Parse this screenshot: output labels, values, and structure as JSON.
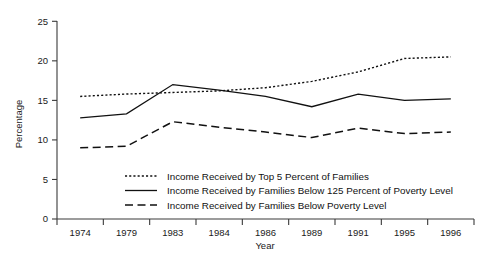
{
  "chart_data": {
    "type": "line",
    "title": "",
    "xlabel": "Year",
    "ylabel": "Percentage",
    "categories": [
      "1974",
      "1979",
      "1983",
      "1984",
      "1986",
      "1989",
      "1991",
      "1995",
      "1996"
    ],
    "x": [
      1974,
      1979,
      1983,
      1984,
      1986,
      1989,
      1991,
      1995,
      1996
    ],
    "ylim": [
      0,
      25
    ],
    "yticks": [
      0,
      5,
      10,
      15,
      20,
      25
    ],
    "ytick_labels": [
      "0",
      "5",
      "10",
      "15",
      "20",
      "25"
    ],
    "grid": false,
    "legend_position": "inside-bottom-center",
    "series": [
      {
        "name": "Income Received by Top 5 Percent of Families",
        "style": "dotted",
        "values": [
          15.5,
          15.8,
          16.0,
          16.2,
          16.6,
          17.4,
          18.6,
          20.3,
          20.5
        ]
      },
      {
        "name": "Income Received by Families Below 125 Percent of Poverty Level",
        "style": "solid",
        "values": [
          12.8,
          13.3,
          17.0,
          16.3,
          15.5,
          14.2,
          15.8,
          15.0,
          15.2
        ]
      },
      {
        "name": "Income Received by Families Below Poverty Level",
        "style": "dashed",
        "values": [
          9.0,
          9.2,
          12.3,
          11.6,
          11.0,
          10.3,
          11.5,
          10.8,
          11.0
        ]
      }
    ],
    "colors": {
      "line": "#111111",
      "axis": "#3a3a3a",
      "background": "#ffffff"
    }
  },
  "axis": {
    "y_title": "Percentage",
    "x_title": "Year"
  },
  "legend": {
    "entries": [
      {
        "label": "Income Received by Top 5 Percent of Families",
        "style": "dotted"
      },
      {
        "label": "Income Received by Families Below 125 Percent of Poverty Level",
        "style": "solid"
      },
      {
        "label": "Income Received by Families Below Poverty Level",
        "style": "dashed"
      }
    ]
  }
}
